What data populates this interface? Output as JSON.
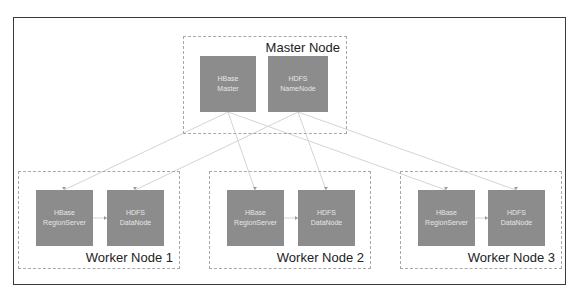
{
  "diagram": {
    "colors": {
      "frame_border": "#3a3a3a",
      "group_border": "#a8a8a8",
      "component_fill": "#8c8c8c",
      "component_text": "#e6e6e6",
      "link_color": "#d4d4d4"
    },
    "master": {
      "label": "Master Node",
      "components": [
        {
          "line1": "HBase",
          "line2": "Master"
        },
        {
          "line1": "HDFS",
          "line2": "NameNode"
        }
      ]
    },
    "workers": [
      {
        "label": "Worker Node 1",
        "components": [
          {
            "line1": "HBase",
            "line2": "RegionServer"
          },
          {
            "line1": "HDFS",
            "line2": "DataNode"
          }
        ]
      },
      {
        "label": "Worker Node 2",
        "components": [
          {
            "line1": "HBase",
            "line2": "RegionServer"
          },
          {
            "line1": "HDFS",
            "line2": "DataNode"
          }
        ]
      },
      {
        "label": "Worker Node 3",
        "components": [
          {
            "line1": "HBase",
            "line2": "RegionServer"
          },
          {
            "line1": "HDFS",
            "line2": "DataNode"
          }
        ]
      }
    ]
  }
}
